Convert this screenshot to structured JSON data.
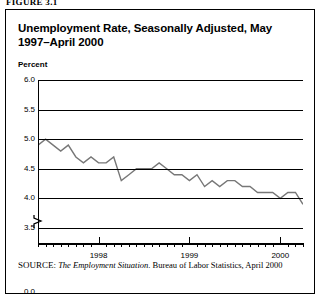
{
  "figure_label": "FIGURE 3.1",
  "title": "Unemployment Rate, Seasonally Adjusted,\nMay 1997–April 2000",
  "axis": {
    "ylabel": "Percent",
    "yticks": [
      "6.0",
      "5.5",
      "5.0",
      "4.5",
      "4.0",
      "3.5",
      "0.0"
    ],
    "xticks": [
      "1998",
      "1999",
      "2000"
    ]
  },
  "source": {
    "prefix": "SOURCE:",
    "italic": "The Employment Situation",
    "rest": ". Bureau of Labor Statistics, April 2000"
  },
  "colors": {
    "line": "#777777",
    "axis": "#000000",
    "background": "#ffffff"
  },
  "chart_data": {
    "type": "line",
    "title": "Unemployment Rate, Seasonally Adjusted, May 1997–April 2000",
    "xlabel": "",
    "ylabel": "Percent",
    "ylim": [
      3.5,
      6.0
    ],
    "ytick_values": [
      6.0,
      5.5,
      5.0,
      4.5,
      4.0,
      3.5
    ],
    "y_axis_break": true,
    "grid": true,
    "legend": "none",
    "x": [
      "1997-05",
      "1997-06",
      "1997-07",
      "1997-08",
      "1997-09",
      "1997-10",
      "1997-11",
      "1997-12",
      "1998-01",
      "1998-02",
      "1998-03",
      "1998-04",
      "1998-05",
      "1998-06",
      "1998-07",
      "1998-08",
      "1998-09",
      "1998-10",
      "1998-11",
      "1998-12",
      "1999-01",
      "1999-02",
      "1999-03",
      "1999-04",
      "1999-05",
      "1999-06",
      "1999-07",
      "1999-08",
      "1999-09",
      "1999-10",
      "1999-11",
      "1999-12",
      "2000-01",
      "2000-02",
      "2000-03",
      "2000-04"
    ],
    "values": [
      4.9,
      5.0,
      4.9,
      4.8,
      4.9,
      4.7,
      4.6,
      4.7,
      4.6,
      4.6,
      4.7,
      4.3,
      4.4,
      4.5,
      4.5,
      4.5,
      4.6,
      4.5,
      4.4,
      4.4,
      4.3,
      4.4,
      4.2,
      4.3,
      4.2,
      4.3,
      4.3,
      4.2,
      4.2,
      4.1,
      4.1,
      4.1,
      4.0,
      4.1,
      4.1,
      3.9
    ],
    "series": [
      {
        "name": "Unemployment rate",
        "values": [
          4.9,
          5.0,
          4.9,
          4.8,
          4.9,
          4.7,
          4.6,
          4.7,
          4.6,
          4.6,
          4.7,
          4.3,
          4.4,
          4.5,
          4.5,
          4.5,
          4.6,
          4.5,
          4.4,
          4.4,
          4.3,
          4.4,
          4.2,
          4.3,
          4.2,
          4.3,
          4.3,
          4.2,
          4.2,
          4.1,
          4.1,
          4.1,
          4.0,
          4.1,
          4.1,
          3.9
        ]
      }
    ]
  }
}
